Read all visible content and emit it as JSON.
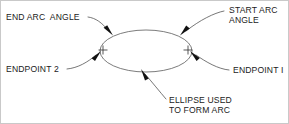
{
  "diagram": {
    "background_color": "#ffffff",
    "line_color": "#4a4a4a",
    "text_color": "#1b1b1b",
    "ellipse_stroke_color": "#5a5a5a",
    "border_color": "#c9c9c9",
    "ellipse": {
      "center_x": 146,
      "center_y": 51,
      "radius_x": 46,
      "radius_y": 21
    },
    "markers": [
      {
        "name": "endpoint-1-cross",
        "x": 188,
        "y": 50,
        "size": 5
      },
      {
        "name": "endpoint-2-cross",
        "x": 103,
        "y": 50,
        "size": 5
      }
    ],
    "labels": {
      "end_arc_angle": "END ARC  ANGLE",
      "start_arc_angle_line1": "START ARC",
      "start_arc_angle_line2": "ANGLE",
      "endpoint_2": "ENDPOINT 2",
      "endpoint_1": "ENDPOINT I",
      "ellipse_used_line1": "ELLIPSE USED",
      "ellipse_used_line2": "TO FORM ARC"
    }
  }
}
